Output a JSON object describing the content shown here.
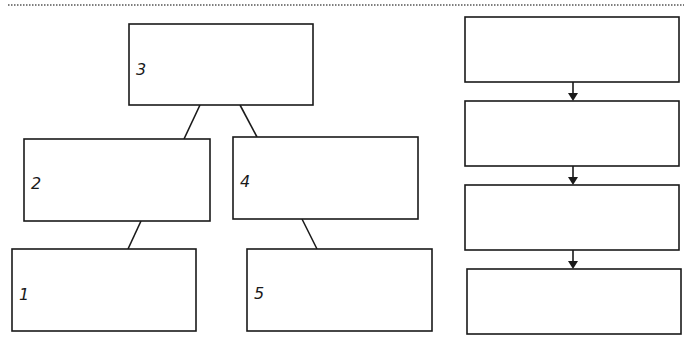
{
  "diagram": {
    "title": "",
    "tree": {
      "nodes": [
        {
          "id": "n3",
          "label": "3",
          "level": 0
        },
        {
          "id": "n2",
          "label": "2",
          "level": 1
        },
        {
          "id": "n4",
          "label": "4",
          "level": 1
        },
        {
          "id": "n1",
          "label": "1",
          "level": 2
        },
        {
          "id": "n5",
          "label": "5",
          "level": 2
        }
      ],
      "edges": [
        {
          "from": "n3",
          "to": "n2"
        },
        {
          "from": "n3",
          "to": "n4"
        },
        {
          "from": "n2",
          "to": "n1"
        },
        {
          "from": "n4",
          "to": "n5"
        }
      ]
    },
    "flow": {
      "nodes": [
        {
          "id": "f1",
          "label": ""
        },
        {
          "id": "f2",
          "label": ""
        },
        {
          "id": "f3",
          "label": ""
        },
        {
          "id": "f4",
          "label": ""
        }
      ],
      "edges": [
        {
          "from": "f1",
          "to": "f2",
          "arrow": true
        },
        {
          "from": "f2",
          "to": "f3",
          "arrow": true
        },
        {
          "from": "f3",
          "to": "f4",
          "arrow": true
        }
      ]
    },
    "colors": {
      "stroke": "#1a1a1a",
      "background": "#ffffff",
      "separator": "#555555"
    }
  }
}
